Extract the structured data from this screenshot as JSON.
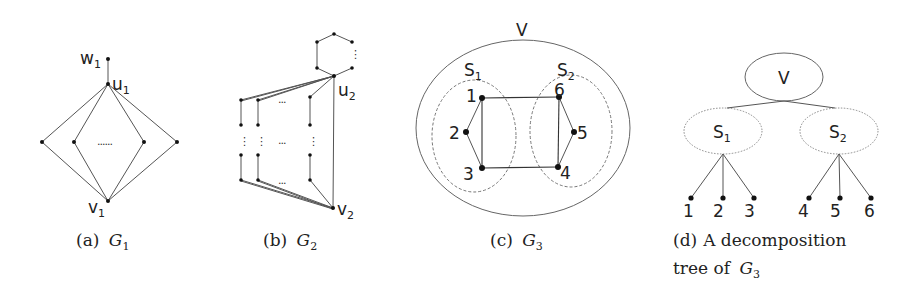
{
  "figure": {
    "subfigures": [
      {
        "id": "a",
        "caption_prefix": "(a)",
        "caption_var": "G",
        "caption_sub": "1",
        "labels": {
          "w": "w",
          "w_sub": "1",
          "u": "u",
          "u_sub": "1",
          "v": "v",
          "v_sub": "1",
          "ellipsis": "......"
        }
      },
      {
        "id": "b",
        "caption_prefix": "(b)",
        "caption_var": "G",
        "caption_sub": "2",
        "labels": {
          "u": "u",
          "u_sub": "2",
          "v": "v",
          "v_sub": "2",
          "h_ellipsis": "...",
          "v_ellipsis": "⋮"
        }
      },
      {
        "id": "c",
        "caption_prefix": "(c)",
        "caption_var": "G",
        "caption_sub": "3",
        "labels": {
          "V": "V",
          "S1": "S",
          "S1_sub": "1",
          "S2": "S",
          "S2_sub": "2",
          "n1": "1",
          "n2": "2",
          "n3": "3",
          "n4": "4",
          "n5": "5",
          "n6": "6"
        }
      },
      {
        "id": "d",
        "caption_prefix": "(d)",
        "caption_line1_rest": "A decomposition",
        "caption_line2_text": "tree of",
        "caption_var": "G",
        "caption_sub": "3",
        "labels": {
          "root": "V",
          "S1": "S",
          "S1_sub": "1",
          "S2": "S",
          "S2_sub": "2",
          "leaves": [
            "1",
            "2",
            "3",
            "4",
            "5",
            "6"
          ]
        }
      }
    ]
  }
}
